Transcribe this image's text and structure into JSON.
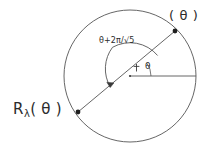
{
  "figure": {
    "kind": "geometric-diagram",
    "background_color": "#ffffff",
    "stroke_color": "#4a4a4a",
    "text_color": "#2b2b2b",
    "labels": {
      "operator": {
        "prefix": "R",
        "subscript": "λ",
        "argument": "( θ )",
        "full": "R λ ( θ )"
      },
      "boundary_point": "( θ )",
      "arc": {
        "theta": "θ",
        "plus": "+",
        "two_pi": "2π",
        "slash": "/",
        "radical": "√5",
        "full": "θ+2π/√5"
      },
      "angle": "θ"
    },
    "geometry": {
      "center_x": 130,
      "center_y": 76,
      "radius": 66,
      "inner_arc_radius": 30,
      "point_theta_x": 175,
      "point_theta_y": 31,
      "point_opposite_x": 78,
      "point_opposite_y": 112,
      "ray_end_x": 196,
      "ray_end_y": 76
    }
  }
}
